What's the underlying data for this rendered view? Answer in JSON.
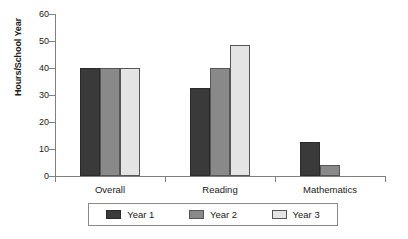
{
  "chart_data": {
    "type": "bar",
    "title": "",
    "xlabel": "",
    "ylabel": "Hours/School Year",
    "categories": [
      "Overall",
      "Reading",
      "Mathematics"
    ],
    "series": [
      {
        "name": "Year 1",
        "color": "#3a3a3a",
        "values": [
          40,
          32.5,
          12.5
        ]
      },
      {
        "name": "Year 2",
        "color": "#898989",
        "values": [
          40,
          40,
          4
        ]
      },
      {
        "name": "Year 3",
        "color": "#e4e4e4",
        "values": [
          40,
          48.5,
          0
        ]
      }
    ],
    "ylim": [
      0,
      60
    ],
    "ytick_values": [
      0,
      10,
      20,
      30,
      40,
      50,
      60
    ],
    "ytick_labels": [
      "0",
      "10",
      "20",
      "30",
      "40",
      "50",
      "60"
    ],
    "grid": false,
    "legend_position": "bottom"
  },
  "legend": {
    "entries": [
      {
        "label": "Year 1"
      },
      {
        "label": "Year 2"
      },
      {
        "label": "Year 3"
      }
    ]
  }
}
